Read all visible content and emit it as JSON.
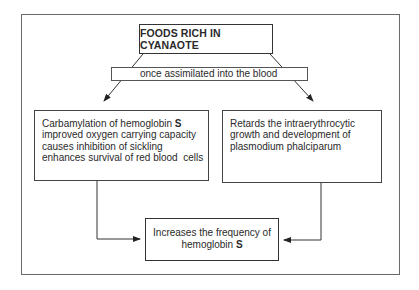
{
  "diagram": {
    "title_box": {
      "label": "FOODS RICH IN CYANAOTE"
    },
    "condition_bar": {
      "label": "once assimilated into the blood"
    },
    "left_box": {
      "lines": [
        "Carbamylation of hemoglobin ",
        "improved oxygen carrying capacity",
        "causes inhibition of sickling",
        "enhances survival of red blood  cells"
      ],
      "bold_suffix": "S"
    },
    "right_box": {
      "lines": [
        "Retards the intraerythrocytic",
        "growth and development of",
        "plasmodium phalciparum"
      ]
    },
    "result_box": {
      "line1": "Increases the frequency of",
      "line2": "hemoglobin ",
      "bold_suffix": "S"
    },
    "colors": {
      "line": "#333333",
      "frame": "#6a6a6a",
      "text": "#2a2a2a",
      "background": "#ffffff"
    }
  }
}
